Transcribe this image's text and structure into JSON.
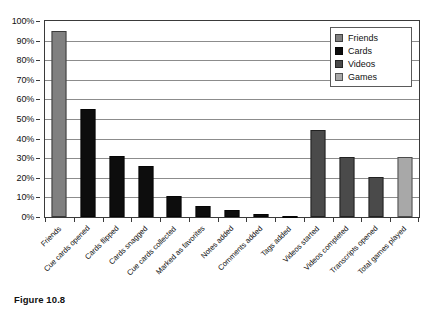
{
  "figure": {
    "caption": "Figure 10.8"
  },
  "chart_data": {
    "type": "bar",
    "title": "",
    "xlabel": "",
    "ylabel": "",
    "ylim": [
      0,
      100
    ],
    "ytick_labels": [
      "100%",
      "90%",
      "80%",
      "70%",
      "60%",
      "50%",
      "40%",
      "30%",
      "20%",
      "10%",
      "0%"
    ],
    "ytick_values": [
      100,
      90,
      80,
      70,
      60,
      50,
      40,
      30,
      20,
      10,
      0
    ],
    "grid": "horizontal",
    "legend_position": "top-right",
    "categories": [
      "Friends",
      "Cue cards opened",
      "Cards flipped",
      "Cards snagged",
      "Cue cards collected",
      "Marked as favorites",
      "Notes added",
      "Comments added",
      "Tags added",
      "Videos started",
      "Videos completed",
      "Transcripts opened",
      "Total games played"
    ],
    "values": [
      95,
      55,
      31,
      26,
      10.5,
      5.5,
      3.5,
      1.5,
      0.5,
      44.5,
      30.5,
      20.5,
      30.5
    ],
    "group_of_bar": [
      "Friends",
      "Cards",
      "Cards",
      "Cards",
      "Cards",
      "Cards",
      "Cards",
      "Cards",
      "Cards",
      "Videos",
      "Videos",
      "Videos",
      "Games"
    ],
    "legend": [
      {
        "name": "Friends",
        "color": "#808080"
      },
      {
        "name": "Cards",
        "color": "#0d0d0d"
      },
      {
        "name": "Videos",
        "color": "#4a4a4a"
      },
      {
        "name": "Games",
        "color": "#a8a8a8"
      }
    ],
    "series_colors": {
      "Friends": "#808080",
      "Cards": "#0d0d0d",
      "Videos": "#4a4a4a",
      "Games": "#a8a8a8"
    }
  }
}
